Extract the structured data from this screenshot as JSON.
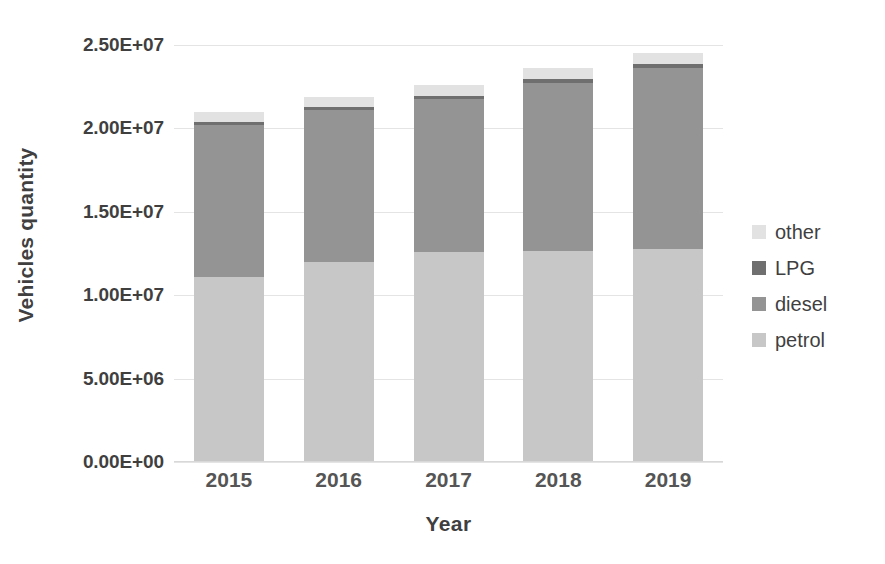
{
  "chart_data": {
    "type": "bar",
    "subtype": "stacked-vertical",
    "title": "",
    "xlabel": "Year",
    "ylabel": "Vehicles quantity",
    "categories": [
      "2015",
      "2016",
      "2017",
      "2018",
      "2019"
    ],
    "ylim": [
      0,
      25000000
    ],
    "ytick_values": [
      0,
      5000000,
      10000000,
      15000000,
      20000000,
      25000000
    ],
    "ytick_labels": [
      "0.00E+00",
      "5.00E+06",
      "1.00E+07",
      "1.50E+07",
      "2.00E+07",
      "2.50E+07"
    ],
    "grid": true,
    "grid_axis": "y",
    "legend_position": "right",
    "legend_order_top_to_bottom": [
      "other",
      "LPG",
      "diesel",
      "petrol"
    ],
    "stack_order_bottom_to_top": [
      "petrol",
      "diesel",
      "LPG",
      "other"
    ],
    "series": [
      {
        "name": "petrol",
        "color": "#c7c7c7",
        "values": [
          11100000,
          12000000,
          12600000,
          12650000,
          12800000
        ]
      },
      {
        "name": "diesel",
        "color": "#949494",
        "values": [
          9100000,
          9100000,
          9150000,
          10100000,
          10850000
        ]
      },
      {
        "name": "LPG",
        "color": "#6f6f6f",
        "values": [
          180000,
          190000,
          200000,
          210000,
          220000
        ]
      },
      {
        "name": "other",
        "color": "#e2e2e2",
        "values": [
          620000,
          610000,
          650000,
          640000,
          630000
        ]
      }
    ],
    "totals": [
      21000000,
      21900000,
      22600000,
      23600000,
      24500000
    ]
  },
  "axes": {
    "y_title": "Vehicles quantity",
    "x_title": "Year"
  },
  "legend": {
    "items": [
      {
        "label": "other",
        "swatch_name": "legend-swatch-other",
        "color": "#e2e2e2"
      },
      {
        "label": "LPG",
        "swatch_name": "legend-swatch-lpg",
        "color": "#6f6f6f"
      },
      {
        "label": "diesel",
        "swatch_name": "legend-swatch-diesel",
        "color": "#949494"
      },
      {
        "label": "petrol",
        "swatch_name": "legend-swatch-petrol",
        "color": "#c7c7c7"
      }
    ]
  },
  "style": {
    "background": "#ffffff",
    "gridline_color": "#e4e4e4",
    "axis_text_color": "#3f3f3f",
    "category_text_color": "#555555"
  }
}
